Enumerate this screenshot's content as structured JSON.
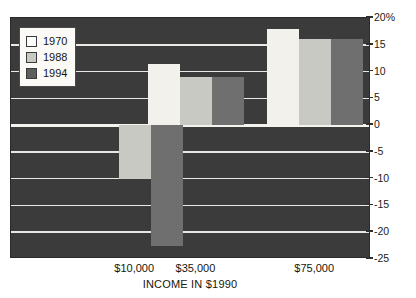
{
  "top_clipped_text": "",
  "legend": {
    "position": "inside-top-left",
    "entries": [
      {
        "label": "1970",
        "color": "#fdfdfb",
        "swatch_name": "legend-swatch-1970"
      },
      {
        "label": "1988",
        "color": "#c9c9c4",
        "swatch_name": "legend-swatch-1988"
      },
      {
        "label": "1994",
        "color": "#5e5e5e",
        "swatch_name": "legend-swatch-1994"
      }
    ]
  },
  "axes": {
    "y_ticks": [
      "20%",
      "15",
      "10",
      "5",
      "0",
      "-5",
      "-10",
      "-15",
      "-20",
      "-25"
    ],
    "y_values": [
      20,
      15,
      10,
      5,
      0,
      -5,
      -10,
      -15,
      -20,
      -25
    ],
    "x_ticks": [
      "$10,000",
      "$35,000",
      "$75,000"
    ],
    "x_title": "INCOME IN $1990"
  },
  "colors": {
    "plot_background": "#3b3b3b",
    "gridline": "#e9e9e4",
    "zeroline": "#f4f3ee",
    "series_1970": "#f2f1ec",
    "series_1988": "#c9c9c4",
    "series_1994": "#6f6f6f",
    "text": "#17170f"
  },
  "chart_data": {
    "type": "bar",
    "title": "",
    "subtitle": "",
    "xlabel": "INCOME IN $1990",
    "ylabel": "",
    "categories": [
      "$10,000",
      "$35,000",
      "$75,000"
    ],
    "series": [
      {
        "name": "1970",
        "values": [
          null,
          11.5,
          18.0
        ]
      },
      {
        "name": "1988",
        "values": [
          -10.0,
          9.0,
          16.0
        ]
      },
      {
        "name": "1994",
        "values": [
          -22.5,
          9.0,
          16.0
        ]
      }
    ],
    "ylim": [
      -25,
      20
    ],
    "ytick_values": [
      20,
      15,
      10,
      5,
      0,
      -5,
      -10,
      -15,
      -20,
      -25
    ],
    "ytick_labels": [
      "20%",
      "15",
      "10",
      "5",
      "0",
      "-5",
      "-10",
      "-15",
      "-20",
      "-25"
    ],
    "y_axis_position": "right",
    "grid": true,
    "grid_axis": "y",
    "legend_entries": [
      "1970",
      "1988",
      "1994"
    ],
    "annotations": []
  }
}
